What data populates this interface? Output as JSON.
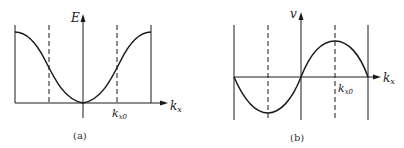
{
  "panel_a": {
    "caption": "(a)",
    "y_axis_label": "E",
    "x_axis_label_main": "k",
    "x_axis_label_sub": "x",
    "tick_label_main": "k",
    "tick_label_sub": "x0",
    "curve": "cosine-band: minimum at k=0, maxima at zone boundaries"
  },
  "panel_b": {
    "caption": "(b)",
    "y_axis_label": "v",
    "x_axis_label_main": "k",
    "x_axis_label_sub": "x",
    "tick_label_main": "k",
    "tick_label_sub": "x0",
    "curve": "sine: zero at k=0 and boundaries, maximum at k_x0, minimum at -k_x0"
  },
  "colors": {
    "line": "#1a1a1a",
    "background": "#ffffff"
  }
}
